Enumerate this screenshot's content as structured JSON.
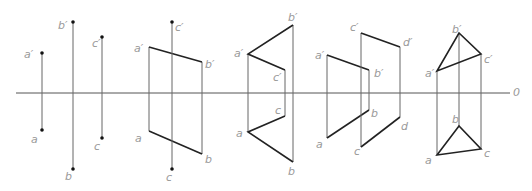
{
  "axis": {
    "label": "0",
    "x1": 16,
    "x2": 510,
    "y": 93
  },
  "figures": [
    {
      "name": "three-points",
      "labels": [
        {
          "text": "a′",
          "x": 24,
          "y": 49
        },
        {
          "text": "b′",
          "x": 58,
          "y": 20
        },
        {
          "text": "c′",
          "x": 92,
          "y": 38
        },
        {
          "text": "a",
          "x": 31,
          "y": 134
        },
        {
          "text": "c",
          "x": 94,
          "y": 141
        },
        {
          "text": "b",
          "x": 65,
          "y": 171
        }
      ]
    },
    {
      "name": "plane-abc-with-point-c",
      "labels": [
        {
          "text": "a′",
          "x": 134,
          "y": 43
        },
        {
          "text": "c′",
          "x": 175,
          "y": 22
        },
        {
          "text": "b′",
          "x": 205,
          "y": 59
        },
        {
          "text": "a",
          "x": 135,
          "y": 133
        },
        {
          "text": "b",
          "x": 205,
          "y": 154
        },
        {
          "text": "c",
          "x": 166,
          "y": 172
        }
      ]
    },
    {
      "name": "quadrilateral-abc",
      "labels": [
        {
          "text": "b′",
          "x": 288,
          "y": 12
        },
        {
          "text": "a′",
          "x": 234,
          "y": 48
        },
        {
          "text": "c′",
          "x": 273,
          "y": 72
        },
        {
          "text": "c",
          "x": 275,
          "y": 105
        },
        {
          "text": "a",
          "x": 236,
          "y": 128
        },
        {
          "text": "b",
          "x": 288,
          "y": 166
        }
      ]
    },
    {
      "name": "two-planes-ab-cd",
      "labels": [
        {
          "text": "a′",
          "x": 315,
          "y": 50
        },
        {
          "text": "c′",
          "x": 350,
          "y": 22
        },
        {
          "text": "d′",
          "x": 403,
          "y": 37
        },
        {
          "text": "b′",
          "x": 374,
          "y": 68
        },
        {
          "text": "b",
          "x": 371,
          "y": 108
        },
        {
          "text": "a",
          "x": 316,
          "y": 139
        },
        {
          "text": "d",
          "x": 401,
          "y": 121
        },
        {
          "text": "c",
          "x": 354,
          "y": 146
        }
      ]
    },
    {
      "name": "triangle-abc",
      "labels": [
        {
          "text": "b′",
          "x": 452,
          "y": 24
        },
        {
          "text": "a′",
          "x": 425,
          "y": 68
        },
        {
          "text": "c′",
          "x": 484,
          "y": 54
        },
        {
          "text": "b",
          "x": 452,
          "y": 114
        },
        {
          "text": "a",
          "x": 425,
          "y": 155
        },
        {
          "text": "c",
          "x": 484,
          "y": 148
        }
      ]
    }
  ],
  "colors": {
    "thick": "#222222",
    "thin": "#555555",
    "label": "#9a9a9a"
  }
}
